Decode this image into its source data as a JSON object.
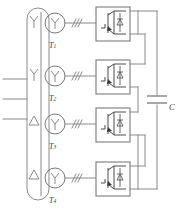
{
  "diagram": {
    "type": "schematic",
    "colors": {
      "wire": "#8a8a8a",
      "device": "#4a4a4a",
      "background": "#ffffff",
      "label": "#3b3b3b"
    },
    "ac_input": {
      "name": "three-phase-ac-input",
      "phase_count": 3,
      "line_labels": [
        "",
        "",
        ""
      ]
    },
    "bus": {
      "name": "input-bus",
      "description": "vertical rounded bus bar feeding four transformer primaries"
    },
    "transformers": [
      {
        "id": "T1",
        "label": "T",
        "subscript": "1",
        "primary_connection": "Y",
        "secondary_connection": "Y",
        "phase_marks": 3
      },
      {
        "id": "T2",
        "label": "T",
        "subscript": "2",
        "primary_connection": "Y",
        "secondary_connection": "Y",
        "phase_marks": 3
      },
      {
        "id": "T3",
        "label": "T",
        "subscript": "3",
        "primary_connection": "△",
        "secondary_connection": "Y",
        "phase_marks": 3
      },
      {
        "id": "T4",
        "label": "T",
        "subscript": "4",
        "primary_connection": "△",
        "secondary_connection": "Y",
        "phase_marks": 3
      }
    ],
    "converters": [
      {
        "id": "conv-1",
        "device": "igbt-with-antiparallel-diode",
        "fed_by": "T1"
      },
      {
        "id": "conv-2",
        "device": "igbt-with-antiparallel-diode",
        "fed_by": "T2"
      },
      {
        "id": "conv-3",
        "device": "igbt-with-antiparallel-diode",
        "fed_by": "T3"
      },
      {
        "id": "conv-4",
        "device": "igbt-with-antiparallel-diode",
        "fed_by": "T4"
      }
    ],
    "dc_link": {
      "capacitor_label": "C",
      "name": "dc-link-capacitor"
    }
  }
}
